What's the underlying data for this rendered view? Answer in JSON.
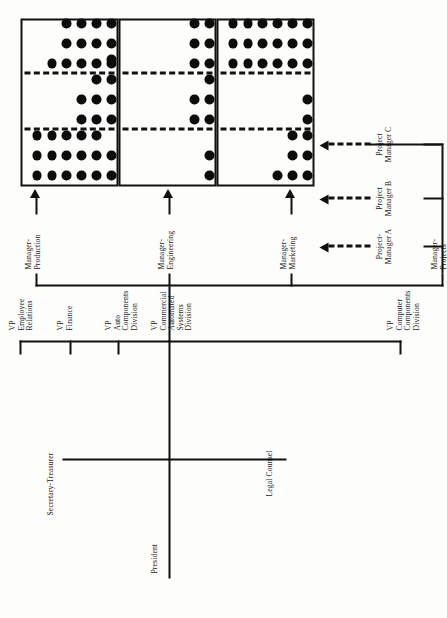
{
  "orientation": "rotated-90-ccw",
  "executive": {
    "president": "President",
    "legal_counsel": "Legal Counsel",
    "secretary_treasurer": "Secretary-Treasurer"
  },
  "vps": [
    {
      "id": "vp-computer-components",
      "line1": "VP",
      "line2": "Computer",
      "line3": "Components",
      "line4": "Division"
    },
    {
      "id": "vp-commercial-automated",
      "line1": "VP",
      "line2": "Commercial",
      "line3": "Automated",
      "line4": "Systems",
      "line5": "Division"
    },
    {
      "id": "vp-auto-components",
      "line1": "VP",
      "line2": "Auto",
      "line3": "Components",
      "line4": "Division"
    },
    {
      "id": "vp-finance",
      "line1": "VP",
      "line2": "Finance"
    },
    {
      "id": "vp-employee-relations",
      "line1": "VP",
      "line2": "Employee",
      "line3": "Relations"
    }
  ],
  "functional_managers": [
    {
      "id": "manager-projects",
      "line1": "Manager-",
      "line2": "Projects"
    },
    {
      "id": "manager-marketing",
      "line1": "Manager-",
      "line2": "Marketing"
    },
    {
      "id": "manager-engineering",
      "line1": "Manager-",
      "line2": "Engineering"
    },
    {
      "id": "manager-production",
      "line1": "Manager-",
      "line2": "Production"
    }
  ],
  "project_managers": [
    {
      "id": "project-manager-a",
      "line1": "Project-",
      "line2": "Manager A"
    },
    {
      "id": "project-manager-b",
      "line1": "Project",
      "line2": "Manager B"
    },
    {
      "id": "project-manager-c",
      "line1": "Project",
      "line2": "Manager C"
    }
  ],
  "colors": {
    "ink": "#111111",
    "paper": "#fdfdfb",
    "dot": "#0c0c0c"
  },
  "chart_data": {
    "type": "table",
    "row_labels": [
      "Manager-Production",
      "Manager-Engineering",
      "Manager-Marketing"
    ],
    "column_labels": [
      "Project-Manager A",
      "Project Manager B",
      "Project Manager C"
    ],
    "counts": [
      [
        17,
        10,
        16
      ],
      [
        2,
        7,
        6
      ],
      [
        7,
        2,
        18
      ]
    ],
    "grid": {
      "Manager-Production": {
        "Project-Manager A": [
          3,
          3,
          3,
          3,
          3,
          2
        ],
        "Project Manager B": [
          0,
          0,
          0,
          2,
          3,
          4
        ],
        "Project Manager C": [
          0,
          1,
          3,
          3,
          3,
          3
        ]
      },
      "Manager-Engineering": {
        "Project-Manager A": [
          0,
          0,
          0,
          0,
          0,
          2
        ],
        "Project Manager B": [
          0,
          0,
          0,
          0,
          2,
          3
        ],
        "Project Manager C": [
          0,
          0,
          0,
          0,
          3,
          3
        ]
      },
      "Manager-Marketing": {
        "Project-Manager A": [
          0,
          0,
          0,
          1,
          3,
          3
        ],
        "Project Manager B": [
          0,
          0,
          0,
          0,
          0,
          2
        ],
        "Project Manager C": [
          3,
          3,
          3,
          3,
          3,
          3
        ]
      }
    },
    "note": "Rows listed top-to-bottom within each panel as drawn in the original landscape orientation."
  }
}
